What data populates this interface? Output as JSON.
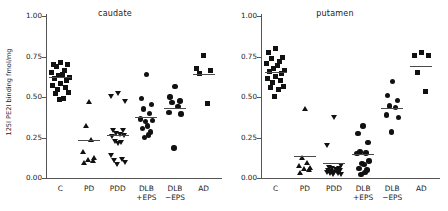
{
  "figure": {
    "ylabel": "125I PE2I binding fmol/mg",
    "yticks": [
      "0.00",
      "0.25",
      "0.50",
      "0.75",
      "1.00"
    ],
    "groups": [
      "C",
      "PD",
      "PDD",
      "DLB\n+EPS",
      "DLB\n−EPS",
      "AD"
    ],
    "marker_color": "#111111",
    "mean_color": "#4a4a4a",
    "axis_color": "#555555"
  },
  "chart_data": [
    {
      "type": "scatter",
      "title": "caudate",
      "xlabel": "",
      "ylabel": "125I PE2I binding fmol/mg",
      "ylim": [
        0.0,
        1.0
      ],
      "yticks": [
        0.0,
        0.25,
        0.5,
        0.75,
        1.0
      ],
      "grid": false,
      "legend": "none",
      "categories": [
        "C",
        "PD",
        "PDD",
        "DLB +EPS",
        "DLB −EPS",
        "AD"
      ],
      "series": [
        {
          "name": "C",
          "marker": "square",
          "mean": 0.625,
          "values": [
            0.71,
            0.7,
            0.7,
            0.69,
            0.66,
            0.65,
            0.64,
            0.63,
            0.62,
            0.61,
            0.6,
            0.585,
            0.57,
            0.555,
            0.545,
            0.525,
            0.52,
            0.49,
            0.485
          ]
        },
        {
          "name": "PD",
          "marker": "triangle-up",
          "mean": 0.235,
          "values": [
            0.47,
            0.32,
            0.235,
            0.16,
            0.125,
            0.115,
            0.105,
            0.095
          ]
        },
        {
          "name": "PDD",
          "marker": "triangle-down",
          "mean": 0.265,
          "values": [
            0.52,
            0.5,
            0.47,
            0.295,
            0.29,
            0.275,
            0.265,
            0.26,
            0.255,
            0.225,
            0.215,
            0.21,
            0.135,
            0.115,
            0.105,
            0.095,
            0.085
          ]
        },
        {
          "name": "DLB +EPS",
          "marker": "circle",
          "mean": 0.375,
          "values": [
            0.64,
            0.49,
            0.455,
            0.425,
            0.4,
            0.365,
            0.355,
            0.35,
            0.32,
            0.305,
            0.285,
            0.265,
            0.25
          ]
        },
        {
          "name": "DLB −EPS",
          "marker": "circle",
          "mean": 0.435,
          "values": [
            0.565,
            0.5,
            0.475,
            0.465,
            0.44,
            0.405,
            0.395,
            0.185
          ]
        },
        {
          "name": "AD",
          "marker": "square",
          "mean": 0.645,
          "values": [
            0.755,
            0.675,
            0.66,
            0.645,
            0.46
          ]
        }
      ]
    },
    {
      "type": "scatter",
      "title": "putamen",
      "xlabel": "",
      "ylabel": "125I PE2I binding fmol/mg",
      "ylim": [
        0.0,
        1.0
      ],
      "yticks": [
        0.0,
        0.25,
        0.5,
        0.75,
        1.0
      ],
      "grid": false,
      "legend": "none",
      "categories": [
        "C",
        "PD",
        "PDD",
        "DLB +EPS",
        "DLB −EPS",
        "AD"
      ],
      "series": [
        {
          "name": "C",
          "marker": "square",
          "mean": 0.655,
          "values": [
            0.8,
            0.775,
            0.745,
            0.735,
            0.715,
            0.705,
            0.695,
            0.675,
            0.665,
            0.655,
            0.645,
            0.625,
            0.615,
            0.6,
            0.59,
            0.565,
            0.555,
            0.545,
            0.5
          ]
        },
        {
          "name": "PD",
          "marker": "triangle-up",
          "mean": 0.135,
          "values": [
            0.43,
            0.125,
            0.095,
            0.075,
            0.065,
            0.055,
            0.05,
            0.03
          ]
        },
        {
          "name": "PDD",
          "marker": "triangle-down",
          "mean": 0.095,
          "values": [
            0.375,
            0.2,
            0.075,
            0.065,
            0.06,
            0.055,
            0.05,
            0.048,
            0.045,
            0.04,
            0.038,
            0.035,
            0.03,
            0.028,
            0.025,
            0.02,
            0.018
          ]
        },
        {
          "name": "DLB +EPS",
          "marker": "circle",
          "mean": 0.15,
          "values": [
            0.32,
            0.275,
            0.22,
            0.16,
            0.155,
            0.15,
            0.105,
            0.09,
            0.085,
            0.06,
            0.05,
            0.035,
            0.02
          ]
        },
        {
          "name": "DLB −EPS",
          "marker": "circle",
          "mean": 0.435,
          "values": [
            0.595,
            0.51,
            0.48,
            0.445,
            0.435,
            0.39,
            0.375,
            0.285
          ]
        },
        {
          "name": "AD",
          "marker": "square",
          "mean": 0.69,
          "values": [
            0.775,
            0.755,
            0.755,
            0.65,
            0.535
          ]
        }
      ]
    }
  ]
}
